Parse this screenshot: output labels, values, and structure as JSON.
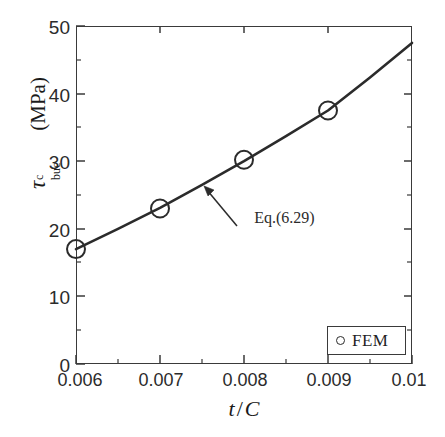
{
  "chart_data": {
    "type": "scatter",
    "title": "",
    "xlabel": "t / C",
    "xlabel_parts": {
      "numerator": "t",
      "slash": "/",
      "denominator": "C"
    },
    "ylabel": "τᶜ_buc (MPa)",
    "ylabel_parts": {
      "symbol": "τ",
      "superscript": "c",
      "subscript": "buc",
      "units": "(MPa)"
    },
    "xlim": [
      0.006,
      0.01
    ],
    "ylim": [
      0,
      50
    ],
    "xticks": [
      0.006,
      0.007,
      0.008,
      0.009,
      0.01
    ],
    "xtick_labels": [
      "0.006",
      "0.007",
      "0.008",
      "0.009",
      "0.01"
    ],
    "yticks": [
      0,
      10,
      20,
      30,
      40,
      50
    ],
    "ytick_labels": [
      "0",
      "10",
      "20",
      "30",
      "40",
      "50"
    ],
    "x_minor_ticks": [
      0.0065,
      0.0075,
      0.0085,
      0.0095
    ],
    "y_minor_ticks": [
      5,
      15,
      25,
      35,
      45
    ],
    "grid": false,
    "tick_direction": "in",
    "legend_position": "lower right",
    "series": [
      {
        "name": "FEM",
        "type": "scatter",
        "marker": "open-circle",
        "color": "#2b2b2b",
        "x": [
          0.006,
          0.007,
          0.008,
          0.009
        ],
        "values": [
          17.0,
          23.0,
          30.2,
          37.5
        ]
      },
      {
        "name": "Eq.(6.29)",
        "type": "line",
        "color": "#2b2b2b",
        "x": [
          0.006,
          0.0065,
          0.007,
          0.0075,
          0.008,
          0.0085,
          0.009,
          0.0095,
          0.01
        ],
        "values": [
          17.0,
          20.0,
          23.1,
          26.5,
          30.0,
          33.7,
          37.5,
          42.4,
          47.5
        ]
      }
    ],
    "annotations": [
      {
        "text": "Eq.(6.29)",
        "text_x": 0.00836,
        "text_y": 21.5,
        "arrow_tip_x": 0.00752,
        "arrow_tip_y": 26.8
      }
    ]
  },
  "legend": {
    "entries": [
      {
        "marker_name": "open-circle-marker",
        "label": "FEM"
      }
    ]
  }
}
